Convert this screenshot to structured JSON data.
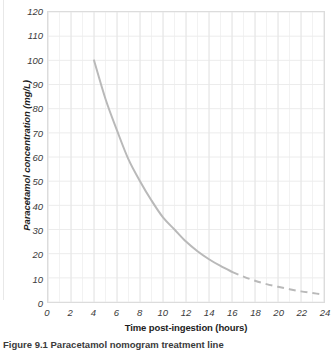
{
  "figure": {
    "caption": "Figure 9.1 Paracetamol nomogram treatment line",
    "background_color": "#ffffff"
  },
  "chart_data": {
    "type": "line",
    "title": "",
    "xlabel": "Time post-ingestion (hours)",
    "ylabel": "Paracetamol concentration (mg/L)",
    "xlim": [
      0,
      24
    ],
    "ylim": [
      0,
      120
    ],
    "xticks": [
      0,
      2,
      4,
      6,
      8,
      10,
      12,
      14,
      16,
      18,
      20,
      22,
      24
    ],
    "yticks": [
      0,
      10,
      20,
      30,
      40,
      50,
      60,
      70,
      80,
      90,
      100,
      110,
      120
    ],
    "xtick_labels": [
      "0",
      "2",
      "4",
      "6",
      "8",
      "10",
      "12",
      "14",
      "16",
      "18",
      "20",
      "22",
      "24"
    ],
    "ytick_labels": [
      "0",
      "10",
      "20",
      "30",
      "40",
      "50",
      "60",
      "70",
      "80",
      "90",
      "100",
      "110",
      "120"
    ],
    "grid": true,
    "grid_minor_x_step": 1,
    "grid_major_y_step": 10,
    "legend": "none",
    "line_color": "#b9b9b9",
    "line_width": 2,
    "series": [
      {
        "name": "Paracetamol treatment line (solid)",
        "style": "solid",
        "x": [
          4,
          5,
          6,
          7,
          8,
          9,
          10,
          11,
          12,
          13,
          14,
          15,
          16
        ],
        "y": [
          100,
          84,
          71,
          59,
          50,
          42,
          35,
          30,
          25,
          21,
          17.7,
          14.9,
          12.5
        ]
      },
      {
        "name": "Paracetamol treatment line (extrapolated, dashed)",
        "style": "dashed",
        "x": [
          16,
          17,
          18,
          19,
          20,
          21,
          22,
          23,
          24
        ],
        "y": [
          12.5,
          10.5,
          8.8,
          7.4,
          6.3,
          5.3,
          4.4,
          3.7,
          3.1
        ]
      }
    ]
  }
}
